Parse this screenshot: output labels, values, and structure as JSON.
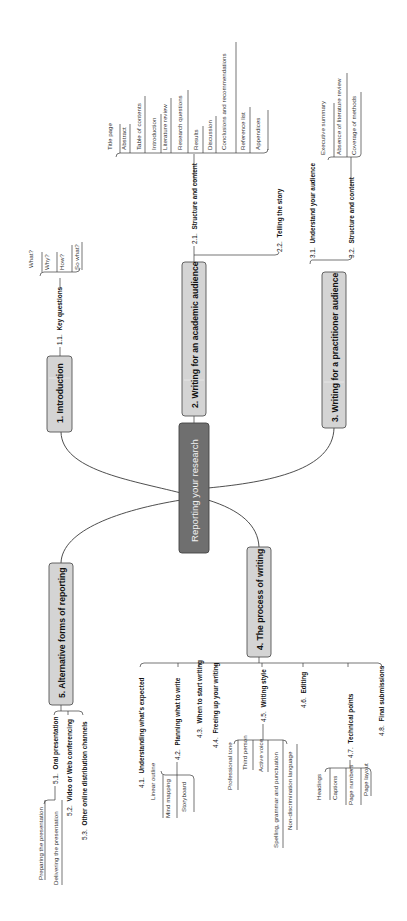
{
  "diagram": {
    "title": "Reporting your research",
    "colors": {
      "center_fill": "#6f6f6f",
      "center_text": "#f2f2f2",
      "branch_fill": "#d4d4d4",
      "line": "#3a3a3a"
    },
    "orientation": "rotated 90 degrees counter-clockwise",
    "branches": [
      {
        "label": "1. Introduction",
        "children": [
          {
            "num": "1.1.",
            "label": "Key questions",
            "leaves": [
              "What?",
              "Why?",
              "How?",
              "So what?"
            ]
          }
        ]
      },
      {
        "label": "2. Writing for an academic audience",
        "children": [
          {
            "num": "2.1.",
            "label": "Structure and content",
            "leaves": [
              "Title page",
              "Abstract",
              "Table of contents",
              "Introduction",
              "Literature review",
              "Research questions",
              "Results",
              "Discussion",
              "Conclusions and recommendations",
              "Reference list",
              "Appendices"
            ]
          },
          {
            "num": "2.2.",
            "label": "Telling the story",
            "leaves": []
          }
        ]
      },
      {
        "label": "3. Writing for a practitioner audience",
        "children": [
          {
            "num": "3.1.",
            "label": "Understand your audience",
            "leaves": []
          },
          {
            "num": "3.2.",
            "label": "Structure and content",
            "leaves": [
              "Executive summary",
              "Absence of literature review",
              "Coverage of methods"
            ]
          }
        ]
      },
      {
        "label": "4. The process of writing",
        "children": [
          {
            "num": "4.1.",
            "label": "Understanding what's expected",
            "leaves": []
          },
          {
            "num": "4.2.",
            "label": "Planning what to write",
            "leaves": [
              "Linear outline",
              "Mind mapping",
              "Storyboard"
            ]
          },
          {
            "num": "4.3.",
            "label": "When to start writing",
            "leaves": []
          },
          {
            "num": "4.4.",
            "label": "Freeing up your writing",
            "leaves": []
          },
          {
            "num": "4.5.",
            "label": "Writing style",
            "leaves": [
              "Professional tone",
              "Third person",
              "Active voice",
              "Spelling, grammar and punctuation",
              "Non-discrimination language"
            ]
          },
          {
            "num": "4.6.",
            "label": "Editing",
            "leaves": []
          },
          {
            "num": "4.7.",
            "label": "Technical points",
            "leaves": [
              "Headings",
              "Captions",
              "Page numbers",
              "Page layout"
            ]
          },
          {
            "num": "4.8.",
            "label": "Final submissions",
            "leaves": []
          }
        ]
      },
      {
        "label": "5. Alternative forms of reporting",
        "children": [
          {
            "num": "5.1.",
            "label": "Oral presentation",
            "leaves": [
              "Preparing the presentation",
              "Delivering the presentation"
            ]
          },
          {
            "num": "5.2.",
            "label": "Video or Web conferencing",
            "leaves": []
          },
          {
            "num": "5.3.",
            "label": "Other online distribution channels",
            "leaves": []
          }
        ]
      }
    ]
  }
}
